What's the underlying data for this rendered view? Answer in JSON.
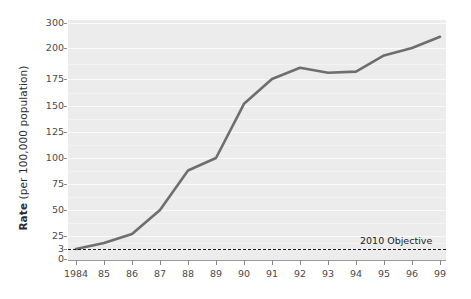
{
  "chart_data": {
    "type": "line",
    "title": "",
    "xlabel": "",
    "ylabel": "Rate (per 100,000 population)",
    "ylabel_bold_prefix": "Rate",
    "ylabel_rest": " (per 100,000 population)",
    "x": [
      1984,
      1985,
      1986,
      1987,
      1988,
      1989,
      1990,
      1991,
      1992,
      1993,
      1994,
      1995,
      1996,
      1999
    ],
    "categories": [
      "1984",
      "85",
      "86",
      "87",
      "88",
      "89",
      "90",
      "91",
      "92",
      "93",
      "94",
      "95",
      "96",
      "99"
    ],
    "values": [
      3,
      13,
      27,
      50,
      88,
      100,
      152,
      175,
      184,
      180,
      181,
      194,
      200,
      245
    ],
    "series": [
      {
        "name": "Rate",
        "color": "#6e6e6e",
        "values": [
          3,
          13,
          27,
          50,
          88,
          100,
          152,
          175,
          184,
          180,
          181,
          194,
          200,
          245
        ]
      }
    ],
    "ytick_labels": [
      "300",
      "200",
      "175",
      "150",
      "125",
      "100",
      "75",
      "50",
      "25",
      "3",
      "0"
    ],
    "ytick_values": [
      300,
      200,
      175,
      150,
      125,
      100,
      75,
      50,
      25,
      3,
      0
    ],
    "ylim": [
      0,
      300
    ],
    "yaxis_note": "broken / non-linear above 200",
    "grid": true,
    "grid_color": "#fbfbfb",
    "panel_color": "#ececec",
    "legend": "none",
    "annotations": [
      {
        "text": "2010 Objective",
        "value": 3,
        "style": "dashed-reference-line",
        "color": "#1c1c1c"
      }
    ]
  },
  "axis": {
    "y_title_prefix": "Rate",
    "y_title_rest": " (per 100,000 population)"
  },
  "annotation": {
    "objective_label": "2010 Objective"
  }
}
